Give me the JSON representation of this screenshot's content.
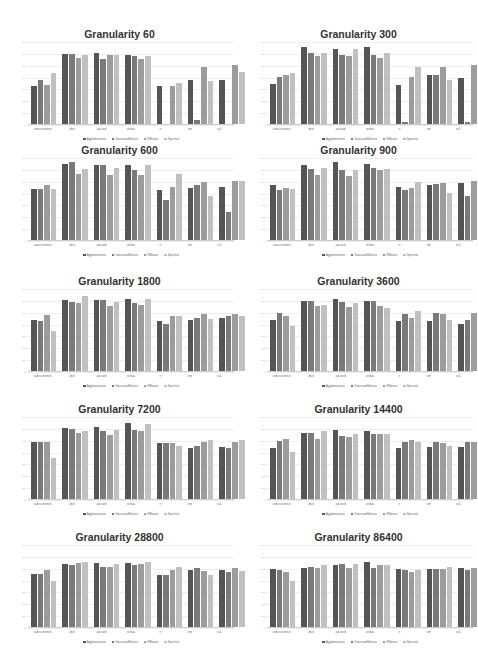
{
  "series_colors": [
    "#555555",
    "#7a7a7a",
    "#9c9c9c",
    "#c0c0c0"
  ],
  "legend": [
    "Agglomerative",
    "GaussianMixture",
    "KMeans",
    "Spectral"
  ],
  "categories": [
    "cooccurrence",
    "dice",
    "jaccard",
    "ochiai",
    "rr",
    "sm",
    "ss1"
  ],
  "y_ticks": [
    "0",
    "0.1",
    "0.2",
    "0.3",
    "0.4",
    "0.5",
    "0.6",
    "0.7"
  ],
  "chart_data": [
    {
      "type": "bar",
      "title": "Granularity 60",
      "categories": [
        "cooccurrence",
        "dice",
        "jaccard",
        "ochiai",
        "rr",
        "sm",
        "ss1"
      ],
      "ylim": [
        0,
        0.7
      ],
      "legend_position": "bottom",
      "series": [
        {
          "name": "Agglomerative",
          "values": [
            0.32,
            0.59,
            0.6,
            0.58,
            0.32,
            0.37,
            0.37
          ]
        },
        {
          "name": "GaussianMixture",
          "values": [
            0.37,
            0.59,
            0.55,
            0.57,
            0.0,
            0.03,
            0.0
          ]
        },
        {
          "name": "KMeans",
          "values": [
            0.33,
            0.56,
            0.58,
            0.55,
            0.32,
            0.48,
            0.5
          ]
        },
        {
          "name": "Spectral",
          "values": [
            0.43,
            0.58,
            0.58,
            0.57,
            0.35,
            0.36,
            0.44
          ]
        }
      ]
    },
    {
      "type": "bar",
      "title": "Granularity 300",
      "categories": [
        "cooccurrence",
        "dice",
        "jaccard",
        "ochiai",
        "rr",
        "sm",
        "ss1"
      ],
      "ylim": [
        0,
        0.7
      ],
      "legend_position": "bottom",
      "series": [
        {
          "name": "Agglomerative",
          "values": [
            0.34,
            0.65,
            0.63,
            0.65,
            0.33,
            0.41,
            0.39
          ]
        },
        {
          "name": "GaussianMixture",
          "values": [
            0.4,
            0.6,
            0.58,
            0.58,
            0.02,
            0.41,
            0.02
          ]
        },
        {
          "name": "KMeans",
          "values": [
            0.41,
            0.57,
            0.57,
            0.56,
            0.4,
            0.48,
            0.5
          ]
        },
        {
          "name": "Spectral",
          "values": [
            0.43,
            0.6,
            0.63,
            0.6,
            0.48,
            0.37,
            0.45
          ]
        }
      ]
    },
    {
      "type": "bar",
      "title": "Granularity 600",
      "categories": [
        "cooccurrence",
        "dice",
        "jaccard",
        "ochiai",
        "rr",
        "sm",
        "ss1"
      ],
      "ylim": [
        0,
        0.7
      ],
      "legend_position": "bottom",
      "series": [
        {
          "name": "Agglomerative",
          "values": [
            0.43,
            0.64,
            0.63,
            0.63,
            0.42,
            0.44,
            0.45
          ]
        },
        {
          "name": "GaussianMixture",
          "values": [
            0.43,
            0.66,
            0.63,
            0.59,
            0.34,
            0.46,
            0.24
          ]
        },
        {
          "name": "KMeans",
          "values": [
            0.46,
            0.56,
            0.55,
            0.55,
            0.45,
            0.49,
            0.5
          ]
        },
        {
          "name": "Spectral",
          "values": [
            0.43,
            0.6,
            0.61,
            0.63,
            0.56,
            0.37,
            0.5
          ]
        }
      ]
    },
    {
      "type": "bar",
      "title": "Granularity 900",
      "categories": [
        "cooccurrence",
        "dice",
        "jaccard",
        "ochiai",
        "rr",
        "sm",
        "ss1"
      ],
      "ylim": [
        0,
        0.7
      ],
      "legend_position": "bottom",
      "series": [
        {
          "name": "Agglomerative",
          "values": [
            0.46,
            0.63,
            0.66,
            0.64,
            0.45,
            0.46,
            0.48
          ]
        },
        {
          "name": "GaussianMixture",
          "values": [
            0.42,
            0.6,
            0.59,
            0.61,
            0.42,
            0.47,
            0.37
          ]
        },
        {
          "name": "KMeans",
          "values": [
            0.44,
            0.55,
            0.54,
            0.59,
            0.44,
            0.48,
            0.5
          ]
        },
        {
          "name": "Spectral",
          "values": [
            0.43,
            0.61,
            0.59,
            0.6,
            0.49,
            0.4,
            0.48
          ]
        }
      ]
    },
    {
      "type": "bar",
      "title": "Granularity 1800",
      "categories": [
        "cooccurrence",
        "dice",
        "jaccard",
        "ochiai",
        "rr",
        "sm",
        "ss1"
      ],
      "ylim": [
        0,
        0.7
      ],
      "legend_position": "bottom",
      "series": [
        {
          "name": "Agglomerative",
          "values": [
            0.43,
            0.6,
            0.6,
            0.61,
            0.42,
            0.43,
            0.45
          ]
        },
        {
          "name": "GaussianMixture",
          "values": [
            0.42,
            0.58,
            0.6,
            0.57,
            0.4,
            0.45,
            0.46
          ]
        },
        {
          "name": "KMeans",
          "values": [
            0.47,
            0.57,
            0.55,
            0.56,
            0.46,
            0.48,
            0.48
          ]
        },
        {
          "name": "Spectral",
          "values": [
            0.34,
            0.63,
            0.58,
            0.61,
            0.46,
            0.44,
            0.46
          ]
        }
      ]
    },
    {
      "type": "bar",
      "title": "Granularity 3600",
      "categories": [
        "cooccurrence",
        "dice",
        "jaccard",
        "ochiai",
        "rr",
        "sm",
        "ss1"
      ],
      "ylim": [
        0,
        0.7
      ],
      "legend_position": "bottom",
      "series": [
        {
          "name": "Agglomerative",
          "values": [
            0.43,
            0.59,
            0.61,
            0.59,
            0.42,
            0.42,
            0.4
          ]
        },
        {
          "name": "GaussianMixture",
          "values": [
            0.49,
            0.59,
            0.58,
            0.59,
            0.48,
            0.49,
            0.43
          ]
        },
        {
          "name": "KMeans",
          "values": [
            0.46,
            0.55,
            0.54,
            0.55,
            0.45,
            0.48,
            0.49
          ]
        },
        {
          "name": "Spectral",
          "values": [
            0.38,
            0.56,
            0.57,
            0.53,
            0.51,
            0.43,
            0.52
          ]
        }
      ]
    },
    {
      "type": "bar",
      "title": "Granularity 7200",
      "categories": [
        "cooccurrence",
        "dice",
        "jaccard",
        "ochiai",
        "rr",
        "sm",
        "ss1"
      ],
      "ylim": [
        0,
        0.7
      ],
      "legend_position": "bottom",
      "series": [
        {
          "name": "Agglomerative",
          "values": [
            0.48,
            0.6,
            0.61,
            0.64,
            0.47,
            0.43,
            0.44
          ]
        },
        {
          "name": "GaussianMixture",
          "values": [
            0.48,
            0.59,
            0.57,
            0.58,
            0.47,
            0.45,
            0.43
          ]
        },
        {
          "name": "KMeans",
          "values": [
            0.48,
            0.56,
            0.54,
            0.57,
            0.47,
            0.48,
            0.48
          ]
        },
        {
          "name": "Spectral",
          "values": [
            0.35,
            0.57,
            0.58,
            0.63,
            0.45,
            0.5,
            0.5
          ]
        }
      ]
    },
    {
      "type": "bar",
      "title": "Granularity 14400",
      "categories": [
        "cooccurrence",
        "dice",
        "jaccard",
        "ochiai",
        "rr",
        "sm",
        "ss1"
      ],
      "ylim": [
        0,
        0.7
      ],
      "legend_position": "bottom",
      "series": [
        {
          "name": "Agglomerative",
          "values": [
            0.43,
            0.56,
            0.58,
            0.57,
            0.43,
            0.44,
            0.44
          ]
        },
        {
          "name": "GaussianMixture",
          "values": [
            0.49,
            0.56,
            0.53,
            0.55,
            0.48,
            0.48,
            0.48
          ]
        },
        {
          "name": "KMeans",
          "values": [
            0.51,
            0.51,
            0.52,
            0.55,
            0.5,
            0.47,
            0.48
          ]
        },
        {
          "name": "Spectral",
          "values": [
            0.4,
            0.57,
            0.55,
            0.55,
            0.48,
            0.45,
            0.46
          ]
        }
      ]
    },
    {
      "type": "bar",
      "title": "Granularity 28800",
      "categories": [
        "cooccurrence",
        "dice",
        "jaccard",
        "ochiai",
        "rr",
        "sm",
        "ss1"
      ],
      "ylim": [
        0,
        0.7
      ],
      "legend_position": "bottom",
      "series": [
        {
          "name": "Agglomerative",
          "values": [
            0.45,
            0.53,
            0.54,
            0.54,
            0.44,
            0.48,
            0.48
          ]
        },
        {
          "name": "GaussianMixture",
          "values": [
            0.45,
            0.52,
            0.51,
            0.52,
            0.44,
            0.5,
            0.46
          ]
        },
        {
          "name": "KMeans",
          "values": [
            0.48,
            0.54,
            0.51,
            0.53,
            0.48,
            0.47,
            0.5
          ]
        },
        {
          "name": "Spectral",
          "values": [
            0.39,
            0.55,
            0.53,
            0.55,
            0.51,
            0.44,
            0.47
          ]
        }
      ]
    },
    {
      "type": "bar",
      "title": "Granularity 86400",
      "categories": [
        "cooccurrence",
        "dice",
        "jaccard",
        "ochiai",
        "rr",
        "sm",
        "ss1"
      ],
      "ylim": [
        0,
        0.7
      ],
      "legend_position": "bottom",
      "series": [
        {
          "name": "Agglomerative",
          "values": [
            0.49,
            0.5,
            0.52,
            0.55,
            0.49,
            0.49,
            0.5
          ]
        },
        {
          "name": "GaussianMixture",
          "values": [
            0.48,
            0.51,
            0.53,
            0.5,
            0.48,
            0.49,
            0.48
          ]
        },
        {
          "name": "KMeans",
          "values": [
            0.46,
            0.5,
            0.5,
            0.52,
            0.46,
            0.49,
            0.5
          ]
        },
        {
          "name": "Spectral",
          "values": [
            0.39,
            0.52,
            0.53,
            0.52,
            0.48,
            0.51,
            0.49
          ]
        }
      ]
    }
  ]
}
